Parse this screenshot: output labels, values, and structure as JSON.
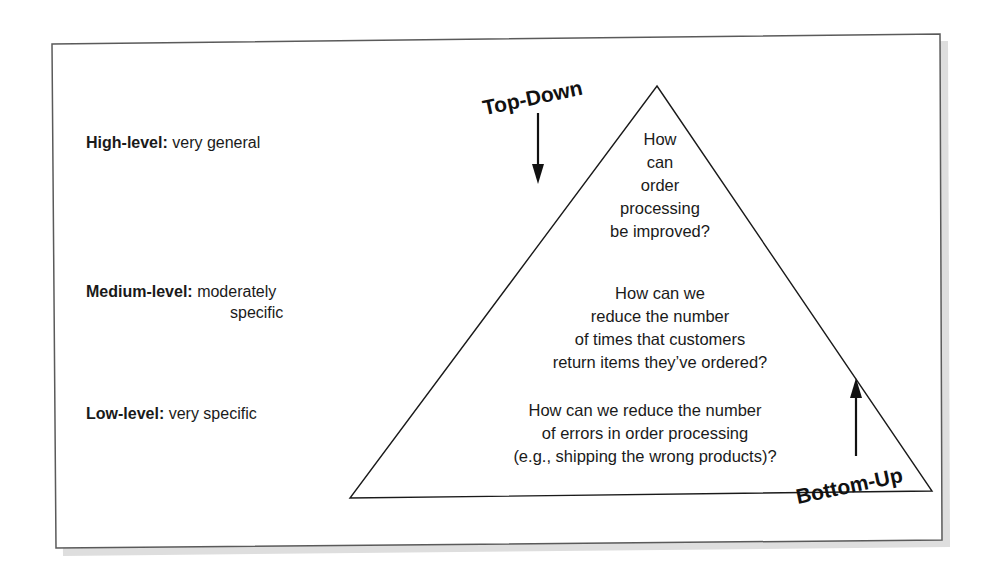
{
  "levels": [
    {
      "label": "High-level:",
      "description": "very general",
      "description_line2": ""
    },
    {
      "label": "Medium-level:",
      "description": "moderately",
      "description_line2": "specific"
    },
    {
      "label": "Low-level:",
      "description": "very specific",
      "description_line2": ""
    }
  ],
  "pyramid": {
    "questions": [
      {
        "lines": [
          "How",
          "can",
          "order",
          "processing",
          "be improved?"
        ]
      },
      {
        "lines": [
          "How can we",
          "reduce the number",
          "of times that customers",
          "return items they’ve ordered?"
        ]
      },
      {
        "lines": [
          "How can we reduce the number",
          "of errors in order processing",
          "(e.g., shipping the wrong products)?"
        ]
      }
    ]
  },
  "directions": {
    "top_down": "Top-Down",
    "bottom_up": "Bottom-Up"
  },
  "colors": {
    "line": "#1a1a1a",
    "frame": "#555555",
    "shadow": "#d9d9d9"
  }
}
